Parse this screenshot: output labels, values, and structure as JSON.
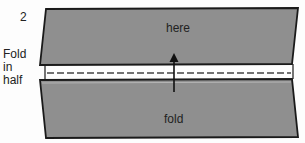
{
  "step_number": "2",
  "side_label": [
    "Fold",
    "in",
    "half"
  ],
  "top_panel_label": "here",
  "bottom_panel_label": "fold",
  "colors": {
    "panel_fill": "#8f8f8f",
    "outline": "#1a1a1a",
    "background": "#fdfdfd",
    "fold_line": "#ffffff"
  },
  "icons": {
    "arrow": "arrow-up-icon"
  }
}
